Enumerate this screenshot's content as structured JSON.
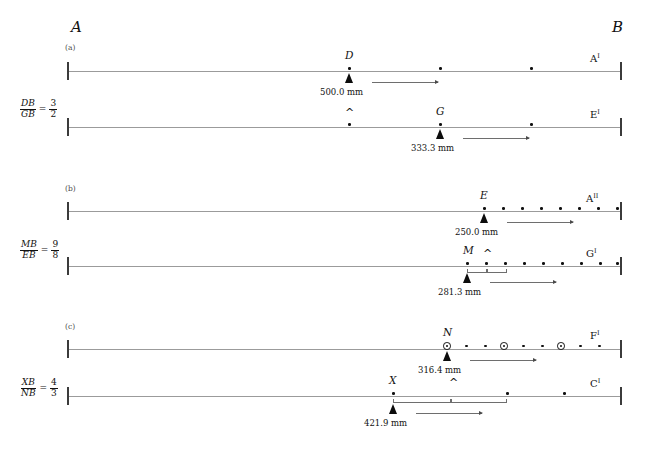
{
  "header": {
    "running_head": "",
    "page_number": ""
  },
  "axis_endpoints": {
    "left": "A",
    "right": "B"
  },
  "panels": [
    {
      "tag": "(a)",
      "ratio": {
        "numerator": "DB",
        "denominator": "GB",
        "equals": "=",
        "value_num": "3",
        "value_den": "2"
      },
      "rows": [
        {
          "right_label": "A",
          "right_prime": "I",
          "marker_label": "D",
          "measure": "500.0 mm",
          "dots": 3,
          "ringed_indices": [],
          "caret": false,
          "bracket": false
        },
        {
          "right_label": "E",
          "right_prime": "I",
          "marker_label": "G",
          "measure": "333.3 mm",
          "dots": 3,
          "ringed_indices": [],
          "caret": true,
          "bracket": false
        }
      ]
    },
    {
      "tag": "(b)",
      "ratio": {
        "numerator": "MB",
        "denominator": "EB",
        "equals": "=",
        "value_num": "9",
        "value_den": "8"
      },
      "rows": [
        {
          "right_label": "A",
          "right_prime": "II",
          "marker_label": "E",
          "measure": "250.0 mm",
          "dots": 8,
          "ringed_indices": [],
          "caret": false,
          "bracket": false
        },
        {
          "right_label": "G",
          "right_prime": "I",
          "marker_label": "M",
          "measure": "281.3 mm",
          "dots": 9,
          "ringed_indices": [],
          "caret": true,
          "bracket": true
        }
      ]
    },
    {
      "tag": "(c)",
      "ratio": {
        "numerator": "XB",
        "denominator": "NB",
        "equals": "=",
        "value_num": "4",
        "value_den": "3"
      },
      "rows": [
        {
          "right_label": "F",
          "right_prime": "I",
          "marker_label": "N",
          "measure": "316.4 mm",
          "dots": 9,
          "ringed_indices": [
            0,
            3,
            6
          ],
          "caret": false,
          "bracket": false
        },
        {
          "right_label": "C",
          "right_prime": "I",
          "marker_label": "X",
          "measure": "421.9 mm",
          "dots": 3,
          "ringed_indices": [],
          "caret": true,
          "bracket": true
        }
      ]
    }
  ],
  "colors": {
    "line": "#9b9b9b",
    "tick": "#3b3b3b",
    "dot": "#111111",
    "marker": "#0c0c0c",
    "arrow": "#6e6e6e",
    "text": "#111111"
  }
}
